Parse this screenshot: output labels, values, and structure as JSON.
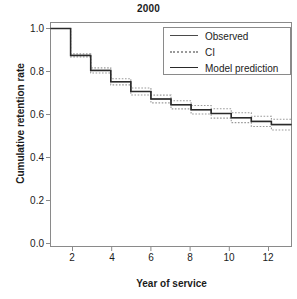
{
  "chart_data": {
    "type": "line",
    "title": "2000",
    "xlabel": "Year of service",
    "ylabel": "Cumulative retention rate",
    "xlim": [
      1,
      13
    ],
    "ylim": [
      0.0,
      1.0
    ],
    "xticks": [
      2,
      4,
      6,
      8,
      10,
      12
    ],
    "yticks": [
      "0.0",
      "0.2",
      "0.4",
      "0.6",
      "0.8",
      "1.0"
    ],
    "grid": false,
    "legend_position": "top-right",
    "step_style": "step-post",
    "x": [
      1,
      2,
      3,
      4,
      5,
      6,
      7,
      8,
      9,
      10,
      11,
      12,
      13
    ],
    "series": [
      {
        "name": "Observed",
        "style": "solid-thin",
        "values": [
          1.0,
          0.875,
          0.805,
          0.752,
          0.707,
          0.672,
          0.645,
          0.622,
          0.605,
          0.585,
          0.568,
          0.553,
          0.553
        ]
      },
      {
        "name": "CI",
        "style": "dotted",
        "bound": "upper",
        "values": [
          1.0,
          0.882,
          0.817,
          0.766,
          0.723,
          0.69,
          0.664,
          0.642,
          0.627,
          0.608,
          0.592,
          0.578,
          0.578
        ]
      },
      {
        "name": "CI",
        "style": "dotted",
        "bound": "lower",
        "values": [
          1.0,
          0.868,
          0.793,
          0.738,
          0.691,
          0.654,
          0.626,
          0.602,
          0.583,
          0.562,
          0.544,
          0.528,
          0.528
        ]
      },
      {
        "name": "Model prediction",
        "style": "solid-thick",
        "values": [
          1.0,
          0.875,
          0.805,
          0.752,
          0.707,
          0.672,
          0.645,
          0.622,
          0.605,
          0.585,
          0.568,
          0.553,
          0.553
        ]
      }
    ],
    "legend": [
      {
        "label": "Observed",
        "style": "solid-thin"
      },
      {
        "label": "CI",
        "style": "dotted"
      },
      {
        "label": "Model prediction",
        "style": "solid-thick"
      }
    ]
  },
  "colors": {
    "axis": "#8a8a8a",
    "observed": "#4a4a4a",
    "ci": "#9a9a9a",
    "model": "#2a2a2a",
    "text": "#1b1b1b",
    "background": "#ffffff"
  }
}
